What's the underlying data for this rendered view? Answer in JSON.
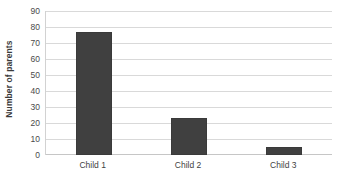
{
  "chart_data": {
    "type": "bar",
    "title": "",
    "subtitle": "",
    "xlabel": "",
    "ylabel": "Number of parents",
    "categories": [
      "Child 1",
      "Child 2",
      "Child 3"
    ],
    "values": [
      77,
      23,
      5
    ],
    "ylim": [
      0,
      90
    ],
    "ytick_step": 10,
    "yticks": [
      0,
      10,
      20,
      30,
      40,
      50,
      60,
      70,
      80,
      90
    ],
    "ytick_labels": [
      "0",
      "10",
      "20",
      "30",
      "40",
      "50",
      "60",
      "70",
      "80",
      "90"
    ],
    "grid": true,
    "grid_axis": "y",
    "legend": false,
    "legend_position": "none",
    "orientation": "vertical",
    "series": [
      {
        "name": "Number of parents",
        "values": [
          77,
          23,
          5
        ]
      }
    ],
    "colors": {
      "bar_fill": "#404040",
      "bar_border": "#3a3a3a",
      "gridline": "#d9d9d9",
      "axis_line": "#c6c6c6",
      "background": "#ffffff",
      "tick_text": "#4a4a4a",
      "axis_title_text": "#3b3b3b"
    }
  }
}
